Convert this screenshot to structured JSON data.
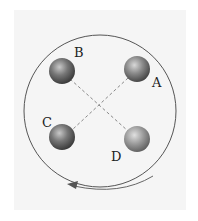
{
  "diagram": {
    "title": "",
    "disc": {
      "cx": 100,
      "cy": 111,
      "r": 76,
      "stroke": "#555555"
    },
    "balls": [
      {
        "id": "A",
        "label": "A",
        "cx": 137,
        "cy": 69,
        "r": 13,
        "color": "#6b6b6b",
        "label_x": 153,
        "label_y": 87
      },
      {
        "id": "B",
        "label": "B",
        "cx": 62,
        "cy": 71,
        "r": 13,
        "color": "#5e5e5e",
        "label_x": 75,
        "label_y": 56
      },
      {
        "id": "C",
        "label": "C",
        "cx": 62,
        "cy": 137,
        "r": 13,
        "color": "#5e5e5e",
        "label_x": 43,
        "label_y": 126
      },
      {
        "id": "D",
        "label": "D",
        "cx": 137,
        "cy": 139,
        "r": 13,
        "color": "#8a8a8a",
        "label_x": 111,
        "label_y": 161
      }
    ],
    "dashed_lines": [
      {
        "from": "B",
        "to": "D"
      },
      {
        "from": "A",
        "to": "C"
      }
    ],
    "rotation": {
      "direction": "counter-clockwise",
      "arrow": "arc-arrow-left"
    }
  }
}
